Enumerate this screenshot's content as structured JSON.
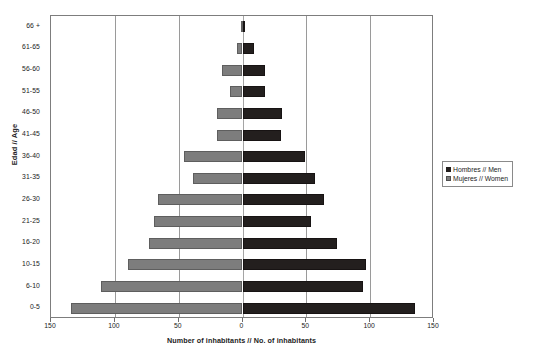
{
  "chart_data": {
    "type": "bar",
    "subtype": "population-pyramid",
    "title": "",
    "xlabel": "Number of inhabitants // No. of inhabitants",
    "ylabel": "Edad // Age",
    "categories": [
      "0-5",
      "6-10",
      "10-15",
      "16-20",
      "21-25",
      "26-30",
      "31-35",
      "36-40",
      "41-45",
      "46-50",
      "51-55",
      "56-60",
      "61-65",
      "66 +"
    ],
    "series": [
      {
        "name": "Hombres // Men",
        "color": "#231f1e",
        "side": "right",
        "values": [
          135,
          94,
          97,
          74,
          54,
          64,
          57,
          49,
          30,
          31,
          18,
          18,
          9,
          2
        ]
      },
      {
        "name": "Mujeres // Women",
        "color": "#7d7d7d",
        "side": "left",
        "values": [
          134,
          111,
          90,
          73,
          69,
          66,
          39,
          46,
          20,
          20,
          10,
          16,
          4,
          1
        ]
      }
    ],
    "xlim": [
      -150,
      150
    ],
    "xticks": [
      -150,
      -100,
      -50,
      0,
      50,
      100,
      150
    ],
    "xtick_labels": [
      "150",
      "100",
      "50",
      "0",
      "50",
      "100",
      "150"
    ],
    "grid": true,
    "legend_position": "right"
  },
  "axes": {
    "y_title": "Edad // Age",
    "x_title": "Number of inhabitants // No. of inhabitants"
  },
  "legend": {
    "items": [
      {
        "label": "Hombres // Men",
        "swatch": "men"
      },
      {
        "label": "Mujeres // Women",
        "swatch": "women"
      }
    ]
  }
}
